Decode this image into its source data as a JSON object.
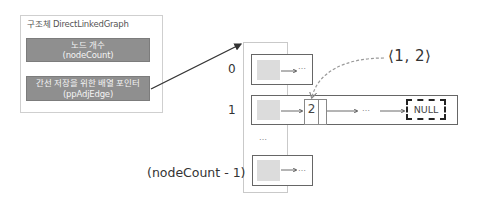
{
  "struct": {
    "title": "구조체 DirectLinkedGraph",
    "fields": [
      {
        "label": "노드 개수",
        "name": "(nodeCount)"
      },
      {
        "label": "간선 저장을 위한 배열 포인터",
        "name": "(ppAdjEdge)"
      }
    ]
  },
  "array": {
    "rows": [
      {
        "index": "0",
        "next": "…"
      },
      {
        "index": "1",
        "nodes": [
          {
            "value": "2"
          }
        ],
        "middle": "…",
        "terminator": "NULL"
      },
      {
        "index": "(nodeCount - 1)",
        "next": "…"
      }
    ],
    "gap_ellipsis": "…"
  },
  "annotation": {
    "edge_label": "⟨1, 2⟩"
  },
  "colors": {
    "field_fill": "#8f8f8f",
    "cell_fill": "#dcdcdc",
    "line": "#333333",
    "dashed_curve": "#999999"
  }
}
